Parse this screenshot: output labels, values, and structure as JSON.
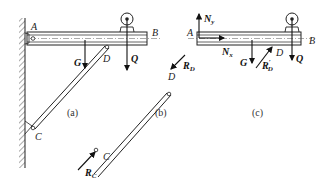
{
  "figure": {
    "panels": [
      {
        "id": "a",
        "caption": "(a)",
        "points": {
          "A": "A",
          "B": "B",
          "C": "C",
          "D": "D"
        },
        "forces": {
          "G": "G",
          "Q": "Q"
        }
      },
      {
        "id": "b",
        "caption": "(b)",
        "points": {
          "C": "C",
          "D": "D"
        },
        "forces": {
          "RD": "R",
          "RD_sub": "D",
          "RC": "R",
          "RC_sub": "C"
        }
      },
      {
        "id": "c",
        "caption": "(c)",
        "points": {
          "A": "A",
          "B": "B",
          "D": "D"
        },
        "forces": {
          "Ny": "N",
          "Ny_sub": "y",
          "Nx": "N",
          "Nx_sub": "x",
          "G": "G",
          "RDp": "R",
          "RDp_sub": "D",
          "RDp_prime": "′",
          "Q": "Q"
        }
      }
    ],
    "colors": {
      "line": "#222222",
      "background": "#ffffff"
    }
  }
}
